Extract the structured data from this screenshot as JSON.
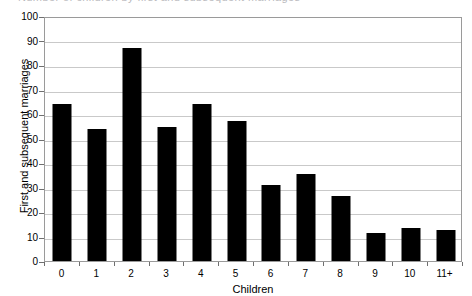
{
  "figure": {
    "clipped_title": "Number of children by first and subsequent marriages",
    "background_color": "#ffffff",
    "bar_color": "#000000",
    "grid_color": "#c9c9c9",
    "frame_color": "#9a9a9a"
  },
  "chart_data": {
    "type": "bar",
    "title": "",
    "xlabel": "Children",
    "ylabel": "First and subsequent marriages",
    "categories": [
      "0",
      "1",
      "2",
      "3",
      "4",
      "5",
      "6",
      "7",
      "8",
      "9",
      "10",
      "11+"
    ],
    "values": [
      64,
      54,
      87,
      54.5,
      64,
      57,
      31,
      35.5,
      26.5,
      11.5,
      13.5,
      12.5
    ],
    "ylim": [
      0,
      100
    ],
    "ytick_labels": [
      "0",
      "10",
      "20",
      "30",
      "40",
      "50",
      "60",
      "70",
      "80",
      "90",
      "100"
    ],
    "ytick_values": [
      0,
      10,
      20,
      30,
      40,
      50,
      60,
      70,
      80,
      90,
      100
    ],
    "grid": "horizontal",
    "legend": "none",
    "series": [
      {
        "name": "First and subsequent marriages",
        "values": [
          64,
          54,
          87,
          54.5,
          64,
          57,
          31,
          35.5,
          26.5,
          11.5,
          13.5,
          12.5
        ]
      }
    ]
  }
}
